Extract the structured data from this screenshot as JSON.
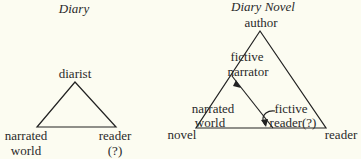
{
  "diary": {
    "title": "Diary",
    "top": "diarist",
    "bottom_left": [
      "narrated",
      "world"
    ],
    "bottom_right": [
      "reader",
      "(?)"
    ]
  },
  "diary_novel": {
    "title": "Diary Novel",
    "top": "author",
    "inner_top": [
      "fictive",
      "narrator"
    ],
    "inner_left": [
      "narrated",
      "world"
    ],
    "inner_right": [
      "fictive",
      "reader(?)"
    ],
    "bottom_left": "novel",
    "bottom_right": "reader"
  }
}
